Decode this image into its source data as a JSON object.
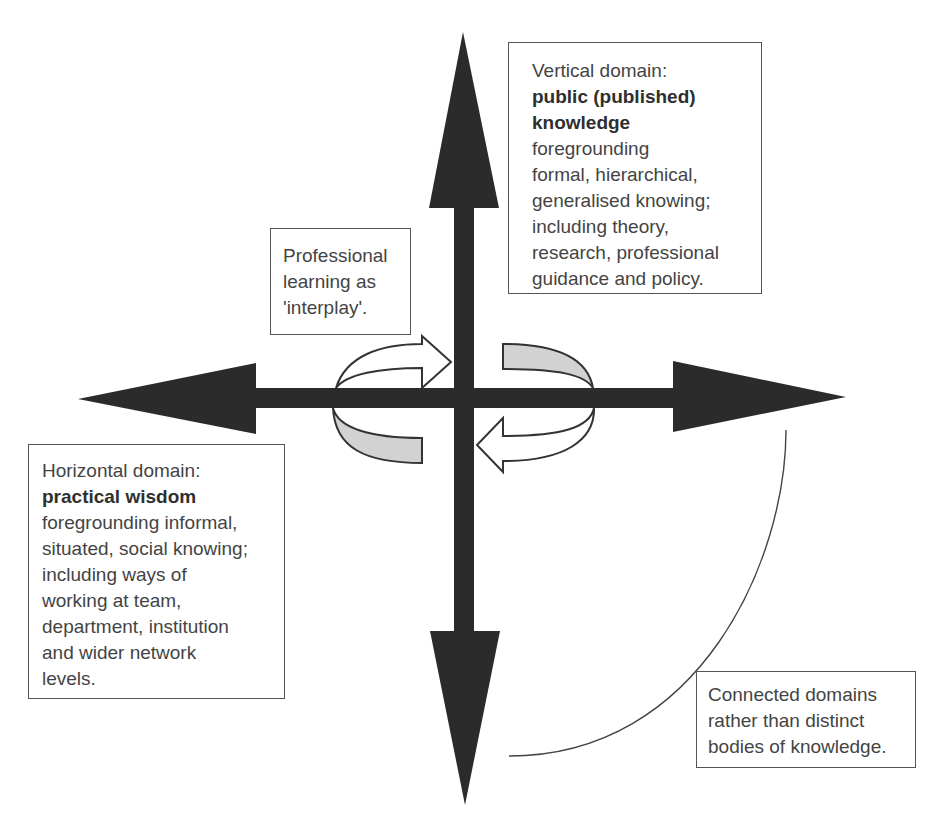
{
  "diagram": {
    "type": "conceptual-axes",
    "colors": {
      "axis": "#2b2b2b",
      "arrow_outline": "#333333",
      "arrow_grey_fill": "#d2d2d2",
      "text": "#444444",
      "box_border": "#555555"
    },
    "axes": {
      "vertical": {
        "label": "Vertical domain",
        "direction": "up-down",
        "arrowheads": [
          "up",
          "down"
        ]
      },
      "horizontal": {
        "label": "Horizontal domain",
        "direction": "left-right",
        "arrowheads": [
          "left",
          "right"
        ]
      }
    },
    "interplay_arrows": [
      {
        "name": "upper-left-arrow",
        "points_to": "right",
        "fill": "white"
      },
      {
        "name": "lower-left-tail",
        "fill": "grey"
      },
      {
        "name": "upper-right-tail",
        "fill": "grey"
      },
      {
        "name": "lower-right-arrow",
        "points_to": "left",
        "fill": "white"
      }
    ],
    "connector": "curved line from right arrow down to bottom arrow, crossing the 'Connected domains' box"
  },
  "boxes": {
    "vertical": {
      "title": "Vertical domain:",
      "bold_lines": [
        "public (published)",
        "knowledge"
      ],
      "lines": [
        "foregrounding",
        "formal, hierarchical,",
        "generalised knowing;",
        "including theory,",
        "research, professional",
        "guidance and policy."
      ]
    },
    "interplay": {
      "lines": [
        "Professional",
        "learning as",
        "'interplay'."
      ]
    },
    "horizontal": {
      "title": "Horizontal domain:",
      "bold_lines": [
        "practical wisdom"
      ],
      "lines": [
        "foregrounding informal,",
        "situated, social knowing;",
        "including ways of",
        "working at team,",
        "department, institution",
        "and wider network",
        "levels."
      ]
    },
    "connected": {
      "lines": [
        "Connected domains",
        "rather than distinct",
        "bodies of knowledge."
      ]
    }
  }
}
